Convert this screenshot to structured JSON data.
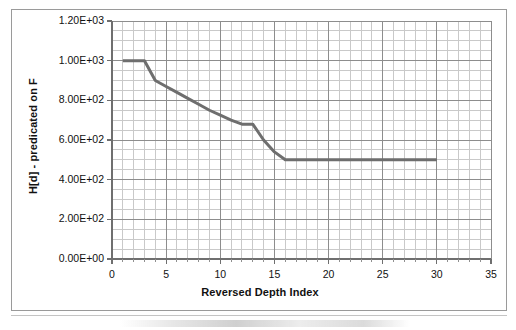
{
  "figure": {
    "background_color": "#ffffff",
    "border_color": "#9a9a9a"
  },
  "chart_data": {
    "type": "line",
    "title": "",
    "xlabel": "Reversed Depth Index",
    "ylabel": "H[d] - predicated on F",
    "xlim": [
      0,
      35
    ],
    "ylim": [
      0,
      1200
    ],
    "grid": true,
    "grid_major_color": "#8d8d8d",
    "grid_minor_color": "#c9c9c9",
    "legend": "none",
    "line_color": "#6e6e6e",
    "line_width": 3,
    "x_ticks": [
      0,
      5,
      10,
      15,
      20,
      25,
      30,
      35
    ],
    "x_tick_labels": [
      "0",
      "5",
      "10",
      "15",
      "20",
      "25",
      "30",
      "35"
    ],
    "x_minor_step": 1,
    "y_ticks": [
      0,
      200,
      400,
      600,
      800,
      1000,
      1200
    ],
    "y_tick_labels": [
      "0.00E+00",
      "2.00E+02",
      "4.00E+02",
      "6.00E+02",
      "8.00E+02",
      "1.00E+03",
      "1.20E+03"
    ],
    "y_minor_step": 50,
    "series": [
      {
        "name": "H[d] - predicated on F",
        "x": [
          1,
          2,
          3,
          4,
          5,
          6,
          7,
          8,
          9,
          10,
          11,
          12,
          13,
          14,
          15,
          16,
          17,
          18,
          19,
          20,
          21,
          22,
          23,
          24,
          25,
          26,
          27,
          28,
          29,
          30
        ],
        "values": [
          1000,
          1000,
          1000,
          900,
          870,
          840,
          810,
          780,
          750,
          725,
          700,
          680,
          680,
          600,
          540,
          500,
          500,
          500,
          500,
          500,
          500,
          500,
          500,
          500,
          500,
          500,
          500,
          500,
          500,
          500
        ]
      }
    ]
  }
}
